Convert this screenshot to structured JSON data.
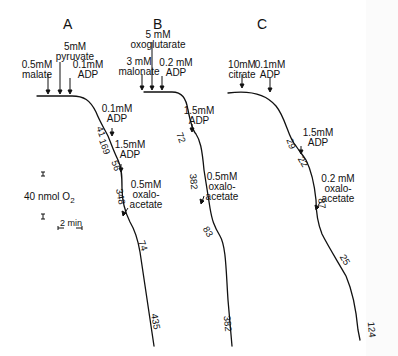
{
  "figure": {
    "panels": [
      {
        "id": "A",
        "title": "A",
        "additions": [
          {
            "label": "0.5mM\nmalate",
            "line1": "0.5mM",
            "line2": "malate"
          },
          {
            "label": "5mM pyruvate",
            "line1": "5mM",
            "line2": "pyruvate"
          },
          {
            "label": "0.1mM ADP",
            "line1": "0.1mM",
            "line2": "ADP"
          },
          {
            "label": "0.1mM ADP",
            "line1": "0.1mM",
            "line2": "ADP"
          },
          {
            "label": "1.5mM ADP",
            "line1": "1.5mM",
            "line2": "ADP"
          },
          {
            "label": "0.5mM oxalo-acetate",
            "line1": "0.5mM",
            "line2": "oxalo-",
            "line3": "acetate"
          }
        ],
        "rates": [
          "41",
          "169",
          "56",
          "348",
          "74",
          "435"
        ]
      },
      {
        "id": "B",
        "title": "B",
        "additions": [
          {
            "line1": "3 mM",
            "line2": "malonate"
          },
          {
            "line1": "5 mM",
            "line2": "oxoglutarate"
          },
          {
            "line1": "0.2 mM",
            "line2": "ADP"
          },
          {
            "line1": "1.5mM",
            "line2": "ADP"
          },
          {
            "line1": "0.5mM",
            "line2": "oxalo-",
            "line3": "acetate"
          }
        ],
        "rates": [
          "72",
          "382",
          "83",
          "382"
        ]
      },
      {
        "id": "C",
        "title": "C",
        "additions": [
          {
            "line1": "10mM",
            "line2": "citrate"
          },
          {
            "line1": "0.1mM",
            "line2": "ADP"
          },
          {
            "line1": "1.5mM",
            "line2": "ADP"
          },
          {
            "line1": "0.2 mM",
            "line2": "oxalo-",
            "line3": "acetate"
          }
        ],
        "rates": [
          "29",
          "22",
          "87",
          "25",
          "124"
        ]
      }
    ],
    "scale": {
      "oxygen": "40 nmol O",
      "oxygen_sub": "2",
      "time": "2 min"
    },
    "colors": {
      "trace": "#111111",
      "background": "#ffffff"
    }
  }
}
